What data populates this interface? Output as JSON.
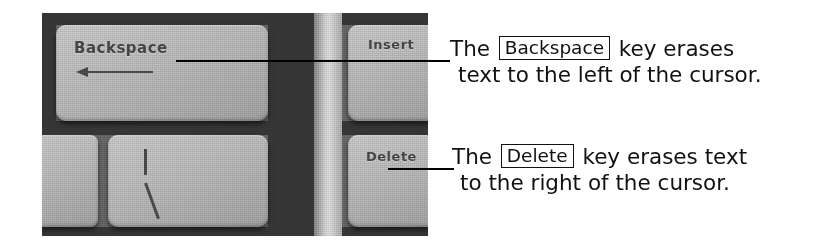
{
  "figure": {
    "kind": "annotated-photograph",
    "background_color": "#ffffff",
    "ink_color": "#111111"
  },
  "photo": {
    "caption_subject": "keyboard-keys-closeup",
    "keys": [
      {
        "id": "backspace",
        "label": "Backspace",
        "glyph": "left-arrow"
      },
      {
        "id": "insert",
        "label": "Insert",
        "glyph": ""
      },
      {
        "id": "delete",
        "label": "Delete",
        "glyph": ""
      },
      {
        "id": "backslash",
        "label": "",
        "glyph": "pipe-backslash"
      },
      {
        "id": "partial-left",
        "label": "",
        "glyph": ""
      }
    ]
  },
  "callouts": [
    {
      "id": "backspace",
      "key_name": "Backspace",
      "line1_before": "The",
      "line1_after": "key erases",
      "line2": "text to the left of the cursor."
    },
    {
      "id": "delete",
      "key_name": "Delete",
      "line1_before": "The",
      "line1_after": "key erases text",
      "line2": "to the right of the cursor."
    }
  ]
}
